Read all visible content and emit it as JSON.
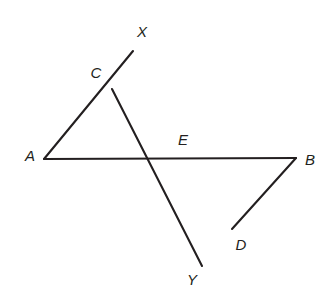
{
  "figure": {
    "background_color": "#ffffff",
    "line_color": "#231f20",
    "line_width": 2.1,
    "canvas": {
      "width": 331,
      "height": 303
    },
    "points": [
      {
        "id": "A",
        "label": "A",
        "x": 44,
        "y": 159,
        "label_x": 30,
        "label_y": 155
      },
      {
        "id": "B",
        "label": "B",
        "x": 296,
        "y": 158,
        "label_x": 310,
        "label_y": 159
      },
      {
        "id": "C",
        "label": "C",
        "x": 112,
        "y": 89,
        "label_x": 96,
        "label_y": 72
      },
      {
        "id": "D",
        "label": "D",
        "x": 232,
        "y": 229,
        "label_x": 241,
        "label_y": 244
      },
      {
        "id": "E",
        "label": "E",
        "x": 171,
        "y": 159,
        "label_x": 183,
        "label_y": 139
      },
      {
        "id": "X",
        "label": "X",
        "x": 133,
        "y": 51,
        "label_x": 142,
        "label_y": 31
      },
      {
        "id": "Y",
        "label": "Y",
        "x": 202,
        "y": 266,
        "label_x": 192,
        "label_y": 279
      }
    ],
    "segments": [
      {
        "id": "seg-AX",
        "name": "segment-a-to-x",
        "from": "A",
        "to": "X",
        "path": "M 44 159 L 133 51",
        "passes_through": "C"
      },
      {
        "id": "seg-CY",
        "name": "segment-c-to-y",
        "from": "C",
        "to": "Y",
        "path": "M 112 89 L 202 266",
        "passes_through": "E, D"
      },
      {
        "id": "seg-AB",
        "name": "segment-a-to-b",
        "from": "A",
        "to": "B",
        "path": "M 44 159 L 296 158",
        "passes_through": "E"
      },
      {
        "id": "seg-DB",
        "name": "segment-d-to-b",
        "from": "D",
        "to": "B",
        "path": "M 232 229 L 296 158",
        "passes_through": ""
      }
    ]
  }
}
